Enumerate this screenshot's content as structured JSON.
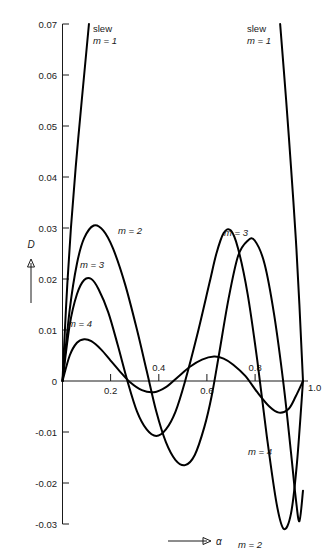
{
  "chart_data": {
    "type": "line",
    "title": "",
    "xlabel": "α",
    "ylabel": "D",
    "xlim": [
      0,
      1.0
    ],
    "ylim": [
      -0.03,
      0.07
    ],
    "grid": false,
    "legend": "inline-curve-labels",
    "x_ticks": [
      "0.2",
      "0.4",
      "0.6",
      "0.8",
      "1.0"
    ],
    "x_tick_values": [
      0.2,
      0.4,
      0.6,
      0.8,
      1.0
    ],
    "y_ticks": [
      "0.07",
      "0.06",
      "0.05",
      "0.04",
      "0.03",
      "0.02",
      "0.01",
      "0",
      "-0.01",
      "-0.02",
      "-0.03"
    ],
    "y_tick_values": [
      0.07,
      0.06,
      0.05,
      0.04,
      0.03,
      0.02,
      0.01,
      0,
      -0.01,
      -0.02,
      -0.03
    ],
    "series": [
      {
        "name": "slew m = 1 (left branch)",
        "label": "slew\nm = 1",
        "m": 1,
        "points": [
          [
            0.0,
            0.0
          ],
          [
            0.01,
            0.01
          ],
          [
            0.02,
            0.019
          ],
          [
            0.035,
            0.03
          ],
          [
            0.055,
            0.042
          ],
          [
            0.08,
            0.055
          ],
          [
            0.1,
            0.065
          ],
          [
            0.11,
            0.07
          ]
        ]
      },
      {
        "name": "slew m = 1 (right branch)",
        "label": "slew\nm = 1",
        "m": 1,
        "points": [
          [
            0.905,
            0.07
          ],
          [
            0.93,
            0.055
          ],
          [
            0.95,
            0.042
          ],
          [
            0.97,
            0.028
          ],
          [
            0.985,
            0.015
          ],
          [
            0.995,
            0.005
          ],
          [
            1.0,
            0.0
          ]
        ]
      },
      {
        "name": "m = 2",
        "label": "m = 2",
        "m": 2,
        "points": [
          [
            0.0,
            0.0
          ],
          [
            0.03,
            0.014
          ],
          [
            0.06,
            0.023
          ],
          [
            0.09,
            0.028
          ],
          [
            0.13,
            0.0305
          ],
          [
            0.17,
            0.0295
          ],
          [
            0.21,
            0.026
          ],
          [
            0.26,
            0.019
          ],
          [
            0.31,
            0.01
          ],
          [
            0.35,
            0.002
          ],
          [
            0.39,
            -0.006
          ],
          [
            0.43,
            -0.012
          ],
          [
            0.47,
            -0.0155
          ],
          [
            0.51,
            -0.0165
          ],
          [
            0.55,
            -0.0145
          ],
          [
            0.59,
            -0.009
          ],
          [
            0.62,
            -0.003
          ],
          [
            0.65,
            0.005
          ],
          [
            0.69,
            0.016
          ],
          [
            0.73,
            0.0245
          ],
          [
            0.77,
            0.0275
          ],
          [
            0.8,
            0.0275
          ],
          [
            0.84,
            0.023
          ],
          [
            0.88,
            0.013
          ],
          [
            0.92,
            -0.001
          ],
          [
            0.95,
            -0.014
          ],
          [
            0.97,
            -0.023
          ],
          [
            0.985,
            -0.0275
          ],
          [
            1.0,
            -0.0215
          ]
        ]
      },
      {
        "name": "m = 3",
        "label": "m = 3",
        "m": 3,
        "points": [
          [
            0.0,
            0.0
          ],
          [
            0.03,
            0.011
          ],
          [
            0.06,
            0.017
          ],
          [
            0.09,
            0.0198
          ],
          [
            0.12,
            0.02
          ],
          [
            0.15,
            0.018
          ],
          [
            0.19,
            0.0135
          ],
          [
            0.23,
            0.007
          ],
          [
            0.27,
            0.0
          ],
          [
            0.31,
            -0.006
          ],
          [
            0.35,
            -0.0095
          ],
          [
            0.39,
            -0.0108
          ],
          [
            0.43,
            -0.0095
          ],
          [
            0.47,
            -0.006
          ],
          [
            0.51,
            0.0
          ],
          [
            0.56,
            0.009
          ],
          [
            0.61,
            0.019
          ],
          [
            0.64,
            0.025
          ],
          [
            0.67,
            0.029
          ],
          [
            0.7,
            0.0295
          ],
          [
            0.73,
            0.026
          ],
          [
            0.77,
            0.017
          ],
          [
            0.81,
            0.004
          ],
          [
            0.85,
            -0.011
          ],
          [
            0.89,
            -0.024
          ],
          [
            0.92,
            -0.029
          ],
          [
            0.95,
            -0.026
          ],
          [
            0.975,
            -0.016
          ],
          [
            1.0,
            0.0
          ]
        ]
      },
      {
        "name": "m = 4",
        "label": "m = 4",
        "m": 4,
        "points": [
          [
            0.0,
            0.0
          ],
          [
            0.03,
            0.005
          ],
          [
            0.06,
            0.0075
          ],
          [
            0.09,
            0.0082
          ],
          [
            0.12,
            0.0078
          ],
          [
            0.16,
            0.0062
          ],
          [
            0.2,
            0.004
          ],
          [
            0.24,
            0.0018
          ],
          [
            0.28,
            -0.0002
          ],
          [
            0.33,
            -0.0018
          ],
          [
            0.38,
            -0.0022
          ],
          [
            0.43,
            -0.0012
          ],
          [
            0.48,
            0.0008
          ],
          [
            0.53,
            0.0028
          ],
          [
            0.58,
            0.0042
          ],
          [
            0.63,
            0.0048
          ],
          [
            0.67,
            0.0044
          ],
          [
            0.71,
            0.0032
          ],
          [
            0.76,
            0.001
          ],
          [
            0.81,
            -0.0022
          ],
          [
            0.86,
            -0.005
          ],
          [
            0.9,
            -0.0062
          ],
          [
            0.94,
            -0.0055
          ],
          [
            0.97,
            -0.003
          ],
          [
            1.0,
            0.0
          ]
        ]
      }
    ],
    "annotations": [
      {
        "id": "slew-left",
        "text": "slew",
        "sub": "m = 1",
        "x": 0.22,
        "y": 0.0645
      },
      {
        "id": "slew-right",
        "text": "slew",
        "sub": "m = 1",
        "x": 0.8,
        "y": 0.0645
      },
      {
        "id": "label-m2-left",
        "text": "m = 2",
        "x": 0.23,
        "y": 0.0322
      },
      {
        "id": "label-m3-left",
        "text": "m = 3",
        "x": 0.1,
        "y": 0.0222
      },
      {
        "id": "label-m4-left",
        "text": "m = 4",
        "x": 0.075,
        "y": 0.0107
      },
      {
        "id": "label-m3-right",
        "text": "m = 3",
        "x": 0.665,
        "y": 0.0317
      },
      {
        "id": "label-m4-right",
        "text": "m = 4",
        "x": 0.845,
        "y": -0.0118
      },
      {
        "id": "label-m2-bottom",
        "text": "m = 2",
        "x": 0.955,
        "y": -0.0305
      }
    ]
  },
  "axes": {
    "y_axis_title": "D",
    "x_axis_title": "α"
  }
}
